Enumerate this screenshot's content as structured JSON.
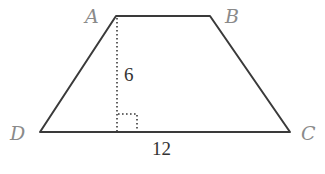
{
  "diagram": {
    "vertices": [
      {
        "label": "A",
        "x": 116,
        "y": 16,
        "label_x": 87,
        "label_y": 22
      },
      {
        "label": "B",
        "x": 210,
        "y": 16,
        "label_x": 225,
        "label_y": 22
      },
      {
        "label": "C",
        "x": 290,
        "y": 132,
        "label_x": 302,
        "label_y": 139
      },
      {
        "label": "D",
        "x": 40,
        "y": 132,
        "label_x": 12,
        "label_y": 139
      }
    ],
    "height_label": "6",
    "base_label": "12",
    "colors": {
      "edge": "#3a3a3a",
      "vertex_label": "#8a8a8a",
      "measure_label": "#333333"
    }
  }
}
